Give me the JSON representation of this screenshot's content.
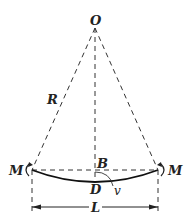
{
  "diagram": {
    "type": "beam bending geometry",
    "labels": {
      "center": "O",
      "radius": "R",
      "midpoint_chord": "B",
      "midpoint_beam": "D",
      "deflection": "v",
      "moment_left": "M",
      "moment_right": "M",
      "length": "L"
    },
    "colors": {
      "line": "#222222",
      "background": "#ffffff"
    }
  }
}
